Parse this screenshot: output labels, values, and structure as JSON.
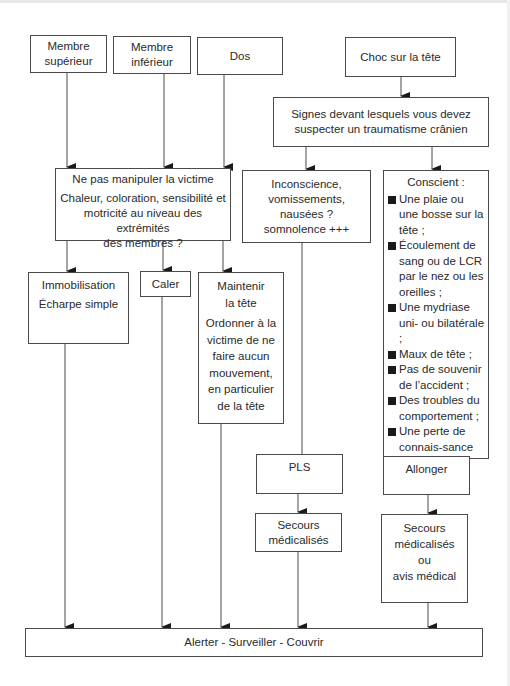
{
  "diagram": {
    "type": "flowchart",
    "nodes": {
      "membre_sup": {
        "lines": [
          "Membre",
          "supérieur"
        ]
      },
      "membre_inf": {
        "lines": [
          "Membre",
          "inférieur"
        ]
      },
      "dos": {
        "lines": [
          "Dos"
        ]
      },
      "choc": {
        "lines": [
          "Choc sur la tête"
        ]
      },
      "signes": {
        "lines": [
          "Signes devant lesquels vous devez",
          "suspecter un traumatisme crânien"
        ]
      },
      "ne_pas_manipuler": {
        "title": "Ne pas manipuler la victime",
        "lines": [
          "Chaleur, coloration, sensibilité et",
          "motricité au niveau des extrémités",
          "des membres ?"
        ]
      },
      "inconscience": {
        "lines": [
          "Inconscience,",
          "vomissements,",
          "nausées ?",
          "somnolence +++"
        ]
      },
      "conscient": {
        "title": "Conscient :",
        "items": [
          "Une plaie ou une bosse sur la tête ;",
          "Écoulement de sang ou de LCR par le nez ou les oreilles ;",
          "Une mydriase uni- ou bilatérale ;",
          "Maux de tête ;",
          "Pas de souvenir de l’accident ;",
          "Des troubles du comportement ;",
          "Une perte de connais-sance initiale ;",
          "Paralysie."
        ]
      },
      "immobilisation": {
        "lines": [
          "Immobilisation",
          "Écharpe simple"
        ]
      },
      "caler": {
        "lines": [
          "Caler"
        ]
      },
      "maintenir": {
        "title_lines": [
          "Maintenir",
          "la tête"
        ],
        "lines": [
          "Ordonner à la",
          "victime de ne",
          "faire aucun",
          "mouvement,",
          "en particulier",
          "de la tête"
        ]
      },
      "pls": {
        "lines": [
          "PLS"
        ]
      },
      "secours1": {
        "lines": [
          "Secours",
          "médicalisés"
        ]
      },
      "allonger": {
        "lines": [
          "Allonger"
        ]
      },
      "secours2": {
        "lines": [
          "Secours",
          "médicalisés",
          "ou",
          "avis médical"
        ]
      },
      "alerter": {
        "lines": [
          "Alerter - Surveiller - Couvrir"
        ]
      }
    },
    "edges": [
      [
        "membre_sup",
        "ne_pas_manipuler"
      ],
      [
        "membre_inf",
        "ne_pas_manipuler"
      ],
      [
        "dos",
        "ne_pas_manipuler"
      ],
      [
        "choc",
        "signes"
      ],
      [
        "signes",
        "inconscience"
      ],
      [
        "signes",
        "conscient"
      ],
      [
        "ne_pas_manipuler",
        "immobilisation"
      ],
      [
        "ne_pas_manipuler",
        "caler"
      ],
      [
        "ne_pas_manipuler",
        "maintenir"
      ],
      [
        "inconscience",
        "pls"
      ],
      [
        "pls",
        "secours1"
      ],
      [
        "conscient",
        "allonger"
      ],
      [
        "allonger",
        "secours2"
      ],
      [
        "immobilisation",
        "alerter"
      ],
      [
        "caler",
        "alerter"
      ],
      [
        "maintenir",
        "alerter"
      ],
      [
        "secours1",
        "alerter"
      ],
      [
        "secours2",
        "alerter"
      ]
    ]
  },
  "colors": {
    "line": "#4a4a4a",
    "text": "#2a2a2a",
    "background": "#ffffff"
  }
}
